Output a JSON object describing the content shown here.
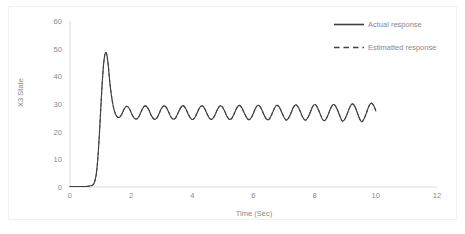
{
  "chart_data": {
    "type": "line",
    "title": "",
    "xlabel": "Time (Sec)",
    "ylabel": "X3 State",
    "xlim": [
      0,
      12
    ],
    "ylim": [
      0,
      60
    ],
    "xticks": [
      "0",
      "2",
      "4",
      "6",
      "8",
      "10",
      "12"
    ],
    "yticks": [
      "0",
      "10",
      "20",
      "30",
      "40",
      "50",
      "60"
    ],
    "grid": false,
    "legend_position": "top-right",
    "line_color": "#404040",
    "axis_text_color": "#898989",
    "series": [
      {
        "name": "Actual response",
        "style": "solid",
        "color": "#404040",
        "x": [
          0.0,
          0.1,
          0.2,
          0.3,
          0.4,
          0.5,
          0.6,
          0.7,
          0.78,
          0.85,
          0.9,
          0.95,
          1.0,
          1.05,
          1.1,
          1.15,
          1.2,
          1.25,
          1.3,
          1.35,
          1.4,
          1.45,
          1.5,
          1.55,
          1.62,
          1.7,
          1.78,
          1.86,
          1.94,
          2.02,
          2.1,
          2.18,
          2.26,
          2.34,
          2.42,
          2.5,
          2.58,
          2.66,
          2.74,
          2.82,
          2.9,
          2.98,
          3.06,
          3.14,
          3.22,
          3.3,
          3.38,
          3.46,
          3.54,
          3.62,
          3.7,
          3.78,
          3.86,
          3.94,
          4.02,
          4.1,
          4.18,
          4.26,
          4.34,
          4.42,
          4.5,
          4.58,
          4.66,
          4.74,
          4.82,
          4.9,
          4.98,
          5.06,
          5.14,
          5.22,
          5.3,
          5.38,
          5.46,
          5.54,
          5.62,
          5.7,
          5.78,
          5.86,
          5.94,
          6.02,
          6.1,
          6.18,
          6.26,
          6.34,
          6.42,
          6.5,
          6.58,
          6.66,
          6.74,
          6.82,
          6.9,
          6.98,
          7.06,
          7.14,
          7.22,
          7.3,
          7.38,
          7.46,
          7.54,
          7.62,
          7.7,
          7.78,
          7.86,
          7.94,
          8.02,
          8.1,
          8.18,
          8.26,
          8.34,
          8.42,
          8.5,
          8.58,
          8.66,
          8.74,
          8.82,
          8.9,
          8.98,
          9.06,
          9.14,
          9.22,
          9.3,
          9.38,
          9.46,
          9.54,
          9.62,
          9.7,
          9.78,
          9.86,
          9.94,
          10.0
        ],
        "y": [
          0.2,
          0.2,
          0.2,
          0.2,
          0.2,
          0.2,
          0.3,
          0.5,
          1.2,
          4.0,
          9.0,
          17.0,
          27.0,
          37.0,
          44.5,
          48.3,
          48.0,
          44.0,
          38.0,
          33.5,
          30.0,
          27.5,
          26.0,
          25.3,
          25.2,
          26.5,
          28.4,
          29.2,
          28.3,
          26.4,
          24.9,
          24.6,
          25.6,
          27.6,
          29.1,
          29.2,
          27.8,
          25.8,
          24.6,
          24.7,
          26.2,
          28.2,
          29.3,
          28.9,
          27.2,
          25.3,
          24.5,
          25.1,
          26.9,
          28.7,
          29.4,
          28.4,
          26.5,
          24.9,
          24.4,
          25.5,
          27.4,
          29.0,
          29.3,
          27.9,
          26.0,
          24.6,
          24.6,
          26.0,
          28.0,
          29.3,
          29.0,
          27.3,
          25.4,
          24.4,
          25.0,
          26.8,
          28.7,
          29.5,
          28.6,
          26.7,
          25.0,
          24.3,
          25.3,
          27.3,
          29.1,
          29.5,
          28.2,
          26.2,
          24.6,
          24.4,
          25.8,
          27.9,
          29.4,
          29.2,
          27.6,
          25.6,
          24.2,
          24.8,
          26.6,
          28.7,
          29.7,
          28.9,
          27.0,
          25.0,
          24.1,
          25.1,
          27.1,
          29.2,
          29.8,
          28.5,
          26.4,
          24.4,
          24.1,
          25.6,
          27.8,
          29.6,
          29.6,
          28.0,
          25.8,
          23.9,
          24.4,
          26.3,
          28.6,
          30.0,
          29.4,
          27.3,
          24.9,
          23.6,
          24.8,
          27.0,
          29.4,
          30.3,
          29.2,
          27.5
        ],
        "peak_value": 48.3,
        "peak_time": 1.15,
        "steady_state_mean": 27.0
      },
      {
        "name": "Estimatted response",
        "style": "dashed",
        "color": "#404040",
        "note": "overlaps the actual response"
      }
    ]
  },
  "legend": {
    "entries": [
      {
        "label": "Actual response",
        "style": "solid"
      },
      {
        "label": "Estimatted response",
        "style": "dashed"
      }
    ]
  },
  "axes": {
    "y_title": "X3 State",
    "x_title": "Time (Sec)",
    "y_tick_labels": [
      "60",
      "50",
      "40",
      "30",
      "20",
      "10",
      "0"
    ],
    "x_tick_labels": [
      "0",
      "2",
      "4",
      "6",
      "8",
      "10",
      "12"
    ]
  }
}
